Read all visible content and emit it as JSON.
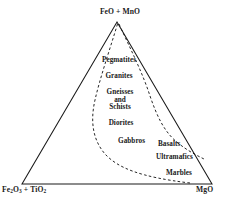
{
  "diagram": {
    "type": "ternary-diagram",
    "title": "",
    "colors": {
      "outline": "#1a1a1a",
      "dashed_boundary": "#1a1a1a",
      "background": "#ffffff",
      "text": "#1a1a1a"
    },
    "vertices": {
      "apex": {
        "label_html": "FeO + MnO",
        "label_plain": "FeO + MnO",
        "position": "top"
      },
      "left": {
        "label_plain": "Fe2O3 + TiO2",
        "species_1": "Fe",
        "sub_1": "2",
        "species_2": "O",
        "sub_2": "3",
        "plus": " + ",
        "species_3": "Ti",
        "species_4": "O",
        "sub_3": "2",
        "position": "bottom-left"
      },
      "right": {
        "label_plain": "MgO",
        "position": "bottom-right"
      }
    },
    "fields": [
      {
        "name": "pegmatites",
        "label": "Pegmatites"
      },
      {
        "name": "granites",
        "label": "Granites"
      },
      {
        "name": "gneisses",
        "label": "Gneisses"
      },
      {
        "name": "gneisses_and",
        "label": "and"
      },
      {
        "name": "schists",
        "label": "Schists"
      },
      {
        "name": "diorites",
        "label": "Diorites"
      },
      {
        "name": "gabbros",
        "label": "Gabbros"
      },
      {
        "name": "basalts",
        "label": "Basalts"
      },
      {
        "name": "ultramafics",
        "label": "Ultramafics"
      },
      {
        "name": "marbles",
        "label": "Marbles"
      }
    ],
    "boundaries": [
      {
        "name": "inner-dashed-boundary",
        "style": "dashed",
        "description": "left-hand dashed curve from apex sweeping down toward MgO corner"
      },
      {
        "name": "outer-dashed-boundary",
        "style": "dashed",
        "description": "right-hand dashed curve from apex sweeping down to right edge"
      }
    ]
  }
}
